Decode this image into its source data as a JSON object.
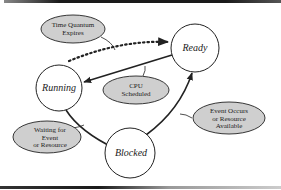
{
  "diagram": {
    "colors": {
      "background": "#ffffff",
      "stroke": "#222222",
      "note_fill": "#cfcfcf",
      "border": "#1a1a1a"
    },
    "states": {
      "ready": {
        "label": "Ready",
        "cx": 195,
        "cy": 48,
        "r": 24
      },
      "running": {
        "label": "Running",
        "cx": 59,
        "cy": 88,
        "r": 23
      },
      "blocked": {
        "label": "Blocked",
        "cx": 130,
        "cy": 153,
        "r": 25
      }
    },
    "notes": {
      "time_quantum": {
        "line1": "Time Quantum",
        "line2": "Expires"
      },
      "cpu_scheduled": {
        "line1": "CPU",
        "line2": "Scheduled"
      },
      "waiting": {
        "line1": "Waiting for",
        "line2": "Event",
        "line3": "or Resource"
      },
      "event_occurs": {
        "line1": "Event Occurs",
        "line2": "or Resource",
        "line3": "Available"
      }
    },
    "transitions": [
      {
        "from": "Running",
        "to": "Ready",
        "style": "dotted",
        "label": "Time Quantum Expires"
      },
      {
        "from": "Ready",
        "to": "Running",
        "style": "solid",
        "label": "CPU Scheduled"
      },
      {
        "from": "Running",
        "to": "Blocked",
        "style": "solid",
        "label": "Waiting for Event or Resource"
      },
      {
        "from": "Blocked",
        "to": "Ready",
        "style": "solid",
        "label": "Event Occurs or Resource Available"
      }
    ]
  }
}
